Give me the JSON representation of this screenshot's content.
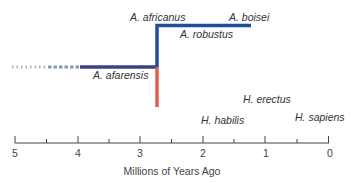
{
  "diagram": {
    "type": "phylogenetic-timeline",
    "colors": {
      "australopithecus_branch": "#1f4f9a",
      "afarensis": "#3d3f8a",
      "homo_branch": "#e2604a",
      "homo_faded": "#f2c9b4",
      "axis": "#444444"
    },
    "species_labels": {
      "a_africanus": "A. africanus",
      "a_boisei": "A. boisei",
      "a_robustus": "A. robustus",
      "a_afarensis": "A. afarensis",
      "h_erectus": "H. erectus",
      "h_habilis": "H. habilis",
      "h_sapiens": "H. sapiens"
    },
    "axis": {
      "title": "Millions of Years Ago",
      "ticks": [
        "5",
        "4",
        "3",
        "2",
        "1",
        "0"
      ],
      "range": [
        5,
        0
      ],
      "minor_ticks": [
        4.5,
        3.5,
        2.5,
        1.5,
        0.5
      ]
    }
  }
}
